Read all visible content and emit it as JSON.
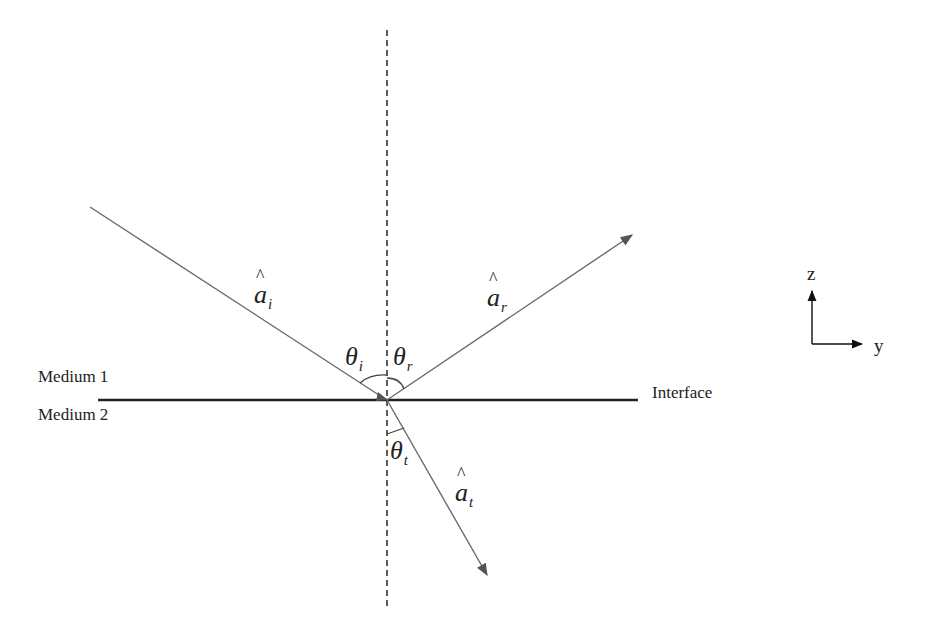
{
  "diagram": {
    "media": {
      "upper": "Medium 1",
      "lower": "Medium 2"
    },
    "interface_label": "Interface",
    "vectors": {
      "incident": {
        "symbol": "a",
        "subscript": "i"
      },
      "reflected": {
        "symbol": "a",
        "subscript": "r"
      },
      "transmitted": {
        "symbol": "a",
        "subscript": "t"
      }
    },
    "angles": {
      "incident": {
        "symbol": "θ",
        "subscript": "i"
      },
      "reflected": {
        "symbol": "θ",
        "subscript": "r"
      },
      "transmitted": {
        "symbol": "θ",
        "subscript": "t"
      }
    },
    "axes": {
      "vertical": "z",
      "horizontal": "y"
    },
    "colors": {
      "interface_line": "#222222",
      "ray": "#6b6b6b",
      "normal": "#333333",
      "text": "#222222"
    }
  }
}
